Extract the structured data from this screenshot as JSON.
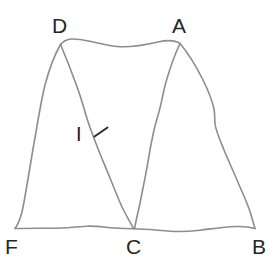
{
  "figure": {
    "background_color": "#ffffff",
    "stroke_color": "#8d8d8d",
    "label_color": "#262626",
    "tick_color": "#2e2e2e",
    "vertices": [
      {
        "name": "D",
        "label": "D",
        "x": 60,
        "y": 44,
        "label_x": 52,
        "label_y": 15
      },
      {
        "name": "A",
        "label": "A",
        "x": 180,
        "y": 44,
        "label_x": 172,
        "label_y": 15
      },
      {
        "name": "F",
        "label": "F",
        "x": 15,
        "y": 228,
        "label_x": 5,
        "label_y": 236
      },
      {
        "name": "C",
        "label": "C",
        "x": 134,
        "y": 228,
        "label_x": 126,
        "label_y": 236
      },
      {
        "name": "B",
        "label": "B",
        "x": 255,
        "y": 228,
        "label_x": 252,
        "label_y": 236
      }
    ],
    "segment_labels": [
      {
        "name": "I",
        "label": "I",
        "x": 76,
        "y": 124
      }
    ],
    "edges": [
      {
        "name": "edge-DA",
        "from": "D",
        "to": "A"
      },
      {
        "name": "edge-DF",
        "from": "D",
        "to": "F"
      },
      {
        "name": "edge-FB",
        "from": "F",
        "to": "B"
      },
      {
        "name": "edge-AB",
        "from": "A",
        "to": "B"
      },
      {
        "name": "edge-DC",
        "from": "D",
        "to": "C"
      },
      {
        "name": "edge-AC",
        "from": "A",
        "to": "C"
      }
    ],
    "tick_marks": [
      {
        "name": "tick-on-DC",
        "on_edge": "edge-DC"
      }
    ]
  }
}
